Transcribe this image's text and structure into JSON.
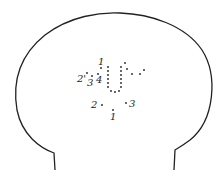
{
  "diagram": {
    "type": "head-outline-electrode-map",
    "outline_color": "#222222",
    "dot_color": "#222222",
    "labels": [
      {
        "id": "top-1",
        "text": "1",
        "x": 98,
        "y": 65
      },
      {
        "id": "top-2",
        "text": "2'",
        "x": 77,
        "y": 82
      },
      {
        "id": "top-3",
        "text": "3",
        "x": 87,
        "y": 86
      },
      {
        "id": "top-4",
        "text": "4",
        "x": 96,
        "y": 83
      },
      {
        "id": "low-2",
        "text": "2",
        "x": 91,
        "y": 108
      },
      {
        "id": "low-3",
        "text": "3",
        "x": 129,
        "y": 107
      },
      {
        "id": "low-1",
        "text": "1",
        "x": 110,
        "y": 120
      }
    ],
    "dots": [
      [
        101,
        68
      ],
      [
        87,
        73
      ],
      [
        92,
        76
      ],
      [
        98,
        74
      ],
      [
        108,
        67
      ],
      [
        108,
        71
      ],
      [
        108,
        75
      ],
      [
        108,
        79
      ],
      [
        108,
        83
      ],
      [
        108,
        87
      ],
      [
        111,
        91
      ],
      [
        115,
        92
      ],
      [
        119,
        91
      ],
      [
        121,
        87
      ],
      [
        121,
        83
      ],
      [
        121,
        79
      ],
      [
        121,
        75
      ],
      [
        121,
        71
      ],
      [
        121,
        67
      ],
      [
        125,
        63
      ],
      [
        127,
        69
      ],
      [
        132,
        74
      ],
      [
        140,
        74
      ],
      [
        144,
        70
      ],
      [
        102,
        105
      ],
      [
        126,
        103
      ],
      [
        113,
        110
      ]
    ]
  }
}
